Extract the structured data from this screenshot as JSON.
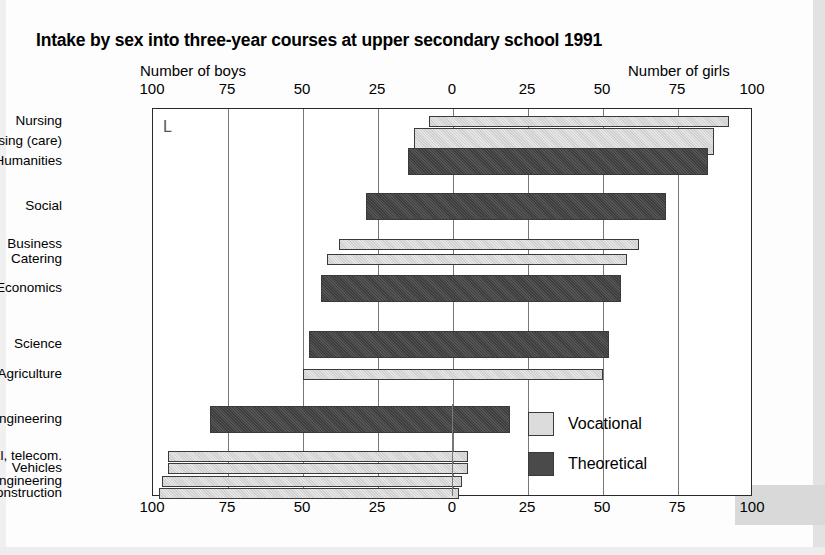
{
  "title": "Intake by sex into three-year courses at upper secondary school 1991",
  "axis": {
    "left_header": "Number of boys",
    "right_header": "Number of girls",
    "ticks": [
      "100",
      "75",
      "50",
      "25",
      "0",
      "25",
      "50",
      "75",
      "100"
    ]
  },
  "legend": {
    "items": [
      {
        "label": "Vocational",
        "color": "#dcdcdc",
        "key": "vocational"
      },
      {
        "label": "Theoretical",
        "color": "#4a4a4a",
        "key": "theoretical"
      }
    ]
  },
  "artifact_mark": "L",
  "chart_data": {
    "type": "bar",
    "title": "Intake by sex into three-year courses at upper secondary school 1991",
    "xlabel": "",
    "ylabel": "",
    "orientation": "horizontal",
    "style": "diverging-percentage",
    "xlim": [
      -100,
      100
    ],
    "xlabel_left": "Number of boys",
    "xlabel_right": "Number of girls",
    "xticks": [
      100,
      75,
      50,
      25,
      0,
      25,
      50,
      75,
      100
    ],
    "grid": true,
    "legend_position": "bottom-right",
    "note": "Each bar spans from the boys percentage on the left axis to the girls percentage on the right axis; the two always sum to 100.",
    "categories": [
      "Nursing",
      "Nursing (care)",
      "Humanities",
      "Social",
      "Business",
      "Catering",
      "Economics",
      "Science",
      "Agriculture",
      "Engineering",
      "El, telecom.",
      "Vehicles",
      "Engineering",
      "Construction"
    ],
    "series": [
      {
        "name": "Number of boys",
        "values": [
          8,
          13,
          15,
          29,
          38,
          42,
          44,
          48,
          50,
          81,
          95,
          95,
          97,
          98
        ]
      },
      {
        "name": "Number of girls",
        "values": [
          92,
          87,
          85,
          71,
          62,
          58,
          56,
          52,
          50,
          19,
          5,
          5,
          3,
          2
        ]
      }
    ],
    "bar_types": [
      "vocational",
      "vocational",
      "theoretical",
      "theoretical",
      "vocational",
      "vocational",
      "theoretical",
      "theoretical",
      "vocational",
      "theoretical",
      "vocational",
      "vocational",
      "vocational",
      "vocational"
    ],
    "bar_thickness": [
      "thin",
      "thick",
      "thick",
      "thick",
      "thin",
      "thin",
      "thick",
      "thick",
      "thin",
      "thick",
      "thin",
      "thin",
      "thin",
      "thin"
    ]
  },
  "geometry": {
    "zero_x": 452,
    "px_per_unit": 3.0,
    "plot_left": 152,
    "plot_top": 108,
    "plot_width": 600,
    "plot_height": 388,
    "rows_y": [
      120,
      140,
      160,
      205,
      243,
      258,
      287,
      343,
      373,
      418,
      455,
      467,
      480,
      492
    ],
    "row_h_thick": 27,
    "row_h_thin": 11
  }
}
